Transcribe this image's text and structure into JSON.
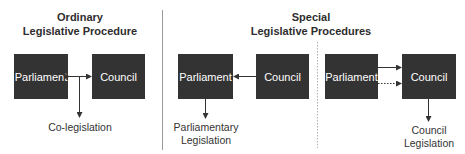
{
  "sections": {
    "ordinary": {
      "title_line1": "Ordinary",
      "title_line2": "Legislative Procedure",
      "box_left": "Parliament",
      "box_right": "Council",
      "outcome": "Co-legislation"
    },
    "special": {
      "title_line1": "Special",
      "title_line2": "Legislative Procedures",
      "parliamentary": {
        "box_left": "Parliament",
        "box_right": "Council",
        "outcome_line1": "Parliamentary",
        "outcome_line2": "Legislation"
      },
      "council": {
        "box_left": "Parliament",
        "box_right": "Council",
        "outcome_line1": "Council",
        "outcome_line2": "Legislation"
      }
    }
  },
  "colors": {
    "box_fill": "#333333",
    "box_text": "#ffffff",
    "line": "#333333",
    "divider": "#9a9a9a"
  }
}
